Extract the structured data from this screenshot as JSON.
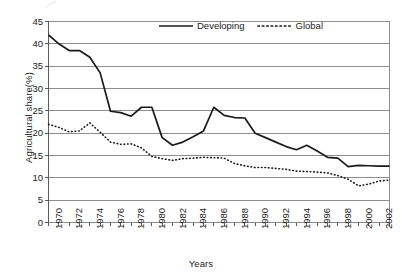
{
  "chart_data": {
    "type": "line",
    "title": "",
    "xlabel": "Years",
    "ylabel": "Agricultural share(%)",
    "xlim": [
      1970,
      2003
    ],
    "ylim": [
      0,
      45
    ],
    "y_ticks": [
      0,
      5,
      10,
      15,
      20,
      25,
      30,
      35,
      40,
      45
    ],
    "x_ticks": [
      1970,
      1971,
      1972,
      1973,
      1974,
      1975,
      1976,
      1977,
      1978,
      1979,
      1980,
      1981,
      1982,
      1983,
      1984,
      1985,
      1986,
      1987,
      1988,
      1989,
      1990,
      1991,
      1992,
      1993,
      1994,
      1995,
      1996,
      1997,
      1998,
      1999,
      2000,
      2001,
      2002,
      2003
    ],
    "x_tick_labels": [
      "1970",
      "",
      "1972",
      "",
      "1974",
      "",
      "1976",
      "",
      "1978",
      "",
      "1980",
      "",
      "1982",
      "",
      "1984",
      "",
      "1986",
      "",
      "1988",
      "",
      "1990",
      "",
      "1992",
      "",
      "1994",
      "",
      "1996",
      "",
      "1998",
      "",
      "2000",
      "",
      "2002",
      ""
    ],
    "grid": "horizontal",
    "legend_position": "top-center",
    "x": [
      1970,
      1971,
      1972,
      1973,
      1974,
      1975,
      1976,
      1977,
      1978,
      1979,
      1980,
      1981,
      1982,
      1983,
      1984,
      1985,
      1986,
      1987,
      1988,
      1989,
      1990,
      1991,
      1992,
      1993,
      1994,
      1995,
      1996,
      1997,
      1998,
      1999,
      2000,
      2001,
      2002,
      2003
    ],
    "series": [
      {
        "name": "Developing",
        "style": "solid",
        "color": "#1a1a1a",
        "values": [
          42.0,
          40.0,
          38.5,
          38.5,
          37.0,
          33.5,
          24.9,
          24.6,
          23.8,
          25.8,
          25.8,
          19.0,
          17.3,
          18.0,
          19.2,
          20.5,
          25.8,
          24.0,
          23.5,
          23.4,
          20.0,
          19.0,
          18.0,
          17.0,
          16.3,
          17.3,
          16.0,
          14.6,
          14.4,
          12.5,
          12.8,
          12.7,
          12.6,
          12.6
        ]
      },
      {
        "name": "Global",
        "style": "dotted",
        "color": "#1a1a1a",
        "values": [
          22.0,
          21.3,
          20.3,
          20.5,
          22.3,
          20.2,
          18.0,
          17.5,
          17.6,
          16.7,
          14.8,
          14.3,
          13.9,
          14.3,
          14.4,
          14.6,
          14.5,
          14.4,
          13.2,
          12.7,
          12.3,
          12.3,
          12.1,
          11.9,
          11.5,
          11.4,
          11.3,
          11.1,
          10.5,
          9.7,
          8.2,
          8.6,
          9.3,
          9.5
        ]
      }
    ]
  },
  "legend": {
    "items": [
      {
        "label": "Developing",
        "style": "solid"
      },
      {
        "label": "Global",
        "style": "dotted"
      }
    ]
  },
  "axes": {
    "y_title": "Agricultural share(%)",
    "x_title": "Years"
  }
}
